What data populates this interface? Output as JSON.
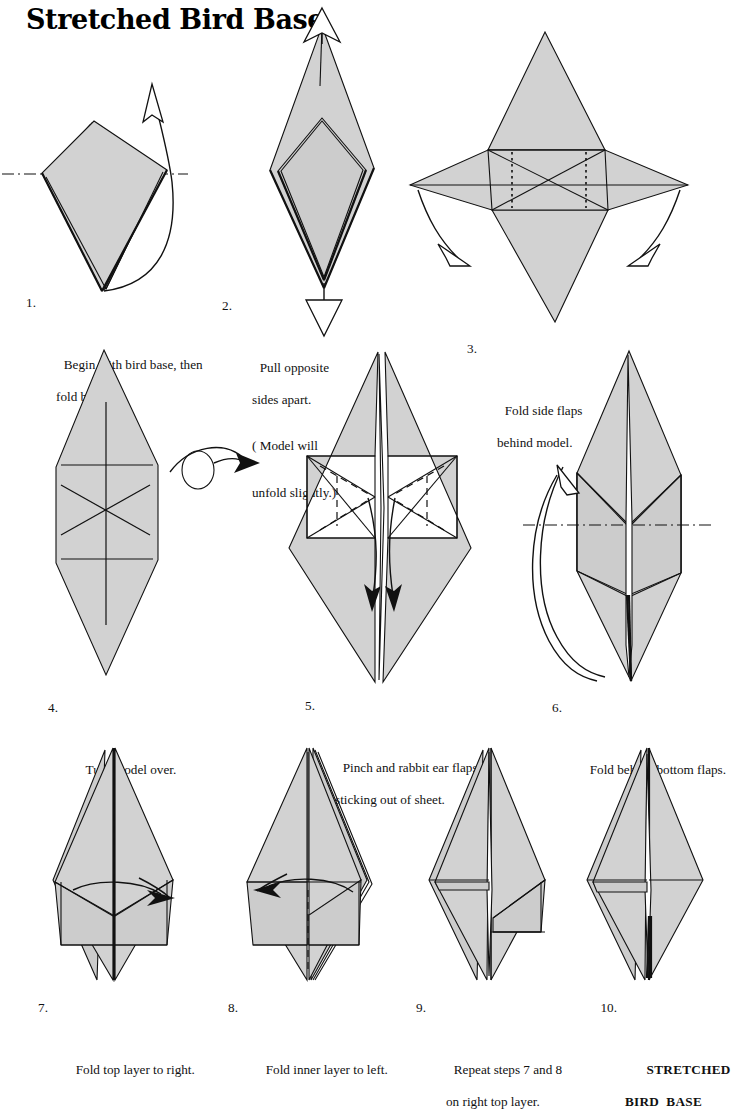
{
  "title": "Stretched Bird Base",
  "steps": [
    {
      "number": "1.",
      "line1": "Begin with bird base, then",
      "line2": "fold back up.",
      "line3": "",
      "diagram": "kite-with-fold-up-arrow"
    },
    {
      "number": "2.",
      "line1": "Pull opposite",
      "line2": "sides apart.",
      "line3": "( Model will",
      "line4": "unfold slightly.)",
      "diagram": "tall-diamond-pull-apart"
    },
    {
      "number": "3.",
      "line1": "Fold side flaps",
      "line2": "behind model.",
      "line3": "",
      "diagram": "four-point-star"
    },
    {
      "number": "4.",
      "line1": "Turn model over.",
      "line2": "",
      "line3": "",
      "diagram": "hexagon-kite-creases"
    },
    {
      "number": "5.",
      "line1": "Pinch and rabbit ear flaps",
      "line2": "sticking out of sheet.",
      "line3": "",
      "diagram": "split-kite-rabbit-ear"
    },
    {
      "number": "6.",
      "line1": "Fold behind bottom flaps.",
      "line2": "",
      "line3": "",
      "diagram": "narrow-kite-fold-behind"
    },
    {
      "number": "7.",
      "line1": "Fold top layer to right.",
      "line2": "",
      "line3": "",
      "diagram": "diamond-fold-right"
    },
    {
      "number": "8.",
      "line1": "Fold inner layer to left.",
      "line2": "",
      "line3": "",
      "diagram": "diamond-fold-left"
    },
    {
      "number": "9.",
      "line1": "Repeat steps 7 and 8",
      "line2": "on right top layer.",
      "line3": "",
      "diagram": "diamond-plain"
    },
    {
      "number": "10.",
      "line1": "STRETCHED",
      "line2": "BIRD  BASE",
      "line3": "",
      "diagram": "finished-stretched-bird-base"
    }
  ],
  "colors": {
    "paper_fill": "#d2d2d2",
    "paper_fill_alt": "#cccccc",
    "ink": "#111111",
    "background": "#ffffff"
  }
}
